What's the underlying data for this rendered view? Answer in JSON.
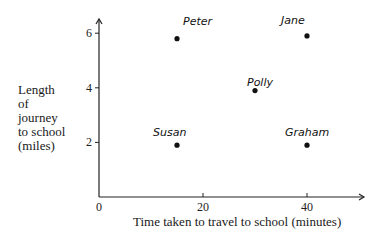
{
  "chart_data": {
    "type": "scatter",
    "title": "",
    "xlabel": "Time taken to travel to school (minutes)",
    "ylabel": "Length of journey to school (miles)",
    "ylabel_lines": [
      "Length",
      "of",
      "journey",
      "to school",
      "(miles)"
    ],
    "xlim": [
      0,
      47
    ],
    "ylim": [
      0,
      6.5
    ],
    "x_ticks": [
      0,
      20,
      40
    ],
    "y_ticks": [
      2,
      4,
      6
    ],
    "grid": false,
    "legend": null,
    "points": [
      {
        "label": "Peter",
        "x": 15,
        "y": 5.8
      },
      {
        "label": "Jane",
        "x": 40,
        "y": 5.9
      },
      {
        "label": "Polly",
        "x": 30,
        "y": 3.9
      },
      {
        "label": "Susan",
        "x": 15,
        "y": 1.9
      },
      {
        "label": "Graham",
        "x": 40,
        "y": 1.9
      }
    ]
  },
  "axis": {
    "origin_label": "0",
    "x_tick_labels": [
      "20",
      "40"
    ],
    "y_tick_labels": [
      "2",
      "4",
      "6"
    ]
  },
  "colors": {
    "ink": "#1a1a1a",
    "background": "#ffffff"
  }
}
